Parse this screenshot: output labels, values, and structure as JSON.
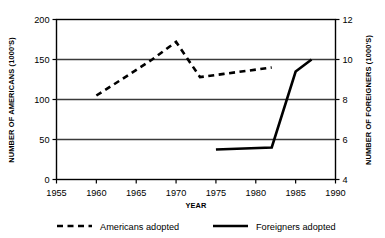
{
  "chart_data": {
    "type": "line",
    "title": "",
    "xlabel": "YEAR",
    "ylabel": "NUMBER OF AMERICANS (1000'S)",
    "y2label": "NUMBER OF FOREIGNERS (1000'S)",
    "xlim": [
      1955,
      1990
    ],
    "ylim": [
      0,
      200
    ],
    "y2lim": [
      4,
      12
    ],
    "xticks": [
      1955,
      1960,
      1965,
      1970,
      1975,
      1980,
      1985,
      1990
    ],
    "xtick_labels": [
      "1955",
      "1960",
      "1965",
      "1970",
      "1975",
      "1980",
      "1985",
      "1990"
    ],
    "yticks": [
      0,
      50,
      100,
      150,
      200
    ],
    "ytick_labels": [
      "0",
      "50",
      "100",
      "150",
      "200"
    ],
    "y2ticks": [
      4,
      6,
      8,
      10,
      12
    ],
    "y2tick_labels": [
      "4",
      "6",
      "8",
      "10",
      "12"
    ],
    "grid": true,
    "legend_position": "below",
    "series": [
      {
        "name": "Americans adopted",
        "axis": "left",
        "style": "dashed",
        "color": "#000000",
        "x": [
          1960,
          1963,
          1967,
          1970,
          1973,
          1976,
          1979,
          1982
        ],
        "values": [
          105,
          124,
          150,
          172,
          128,
          132,
          136,
          140
        ]
      },
      {
        "name": "Foreigners adopted",
        "axis": "right",
        "style": "solid",
        "color": "#000000",
        "x": [
          1975,
          1982,
          1985,
          1987
        ],
        "values": [
          5.5,
          5.6,
          9.4,
          10.0
        ]
      }
    ],
    "legend": [
      {
        "label": "Americans adopted",
        "style": "dashed"
      },
      {
        "label": "Foreigners adopted",
        "style": "solid"
      }
    ]
  }
}
